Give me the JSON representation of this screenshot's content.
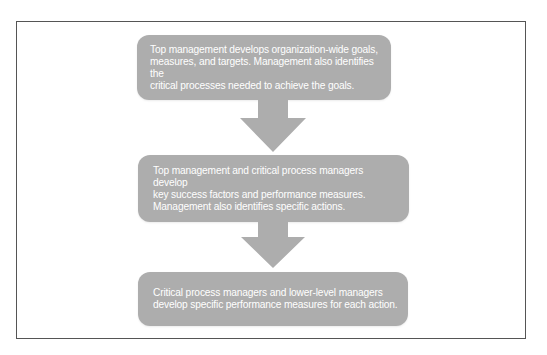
{
  "diagram": {
    "type": "flowchart",
    "direction": "top-to-bottom",
    "colors": {
      "box_fill": "#adadad",
      "box_text": "#ffffff",
      "arrow_fill": "#adadad",
      "frame_border": "#555555",
      "background": "#ffffff"
    },
    "steps": [
      {
        "text": "Top management develops organization-wide goals,\nmeasures, and targets. Management also identifies the\ncritical processes needed to achieve the goals."
      },
      {
        "text": "Top management and critical process managers develop\nkey success factors and performance measures.\nManagement also identifies specific actions."
      },
      {
        "text": "Critical process managers and lower-level managers\ndevelop specific performance measures for each action."
      }
    ],
    "connectors": [
      {
        "from": 0,
        "to": 1,
        "icon": "down-arrow-icon"
      },
      {
        "from": 1,
        "to": 2,
        "icon": "down-arrow-icon"
      }
    ]
  }
}
